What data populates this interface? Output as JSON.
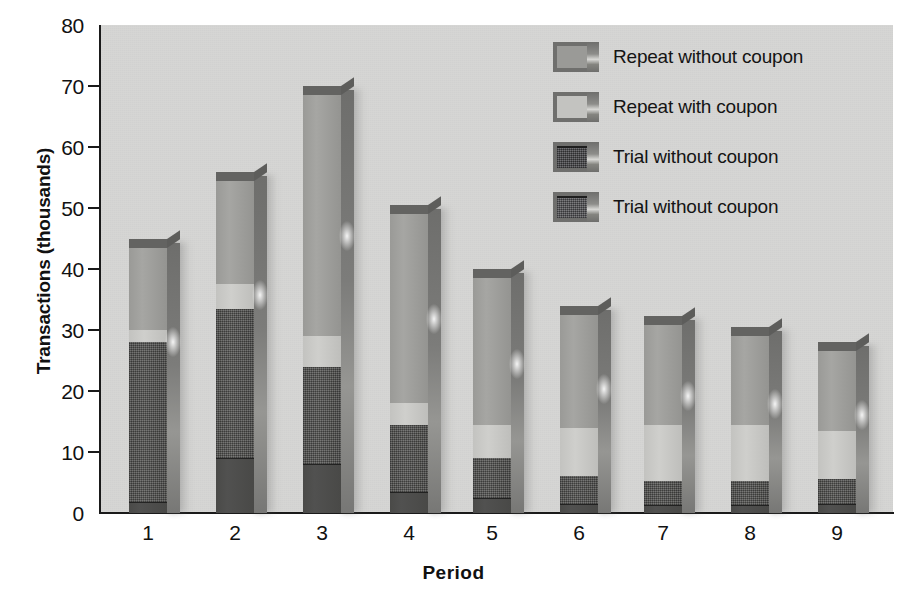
{
  "chart_data": {
    "type": "bar",
    "title": "",
    "subtitle": "",
    "xlabel": "Period",
    "ylabel": "Transactions (thousands)",
    "categories": [
      "1",
      "2",
      "3",
      "4",
      "5",
      "6",
      "7",
      "8",
      "9"
    ],
    "ylim": [
      0,
      80
    ],
    "yticks": [
      0,
      10,
      20,
      30,
      40,
      50,
      60,
      70,
      80
    ],
    "ytick_labels": [
      "0",
      "10",
      "20",
      "30",
      "40",
      "50",
      "60",
      "70",
      "80"
    ],
    "grid": false,
    "stacked": true,
    "legend_position": "top-right",
    "series": [
      {
        "name": "Trial with coupon",
        "legend_label": "Trial without coupon",
        "color": "#4a4a48",
        "values": [
          1.8,
          9.0,
          8.0,
          3.5,
          2.5,
          1.5,
          1.3,
          1.3,
          1.4
        ]
      },
      {
        "name": "Trial without coupon",
        "legend_label": "Trial without coupon",
        "color": "#4f4f4d",
        "values": [
          26.2,
          24.5,
          16.0,
          11.0,
          6.5,
          4.5,
          4.0,
          4.0,
          4.1
        ]
      },
      {
        "name": "Repeat with coupon",
        "legend_label": "Repeat with coupon",
        "color": "#c3c3c0",
        "values": [
          2.0,
          4.0,
          5.0,
          3.5,
          5.5,
          8.0,
          9.2,
          9.2,
          8.0
        ]
      },
      {
        "name": "Repeat without coupon",
        "legend_label": "Repeat without coupon",
        "color": "#9a9a97",
        "values": [
          13.5,
          17.0,
          39.5,
          31.0,
          24.0,
          18.5,
          16.3,
          14.5,
          13.0
        ]
      }
    ],
    "totals": [
      43.5,
      54.5,
      68.5,
      49.0,
      38.5,
      32.5,
      30.8,
      29.0,
      26.5
    ]
  },
  "legend": {
    "items": [
      {
        "label": "Repeat without coupon",
        "swatch": "#9a9a97"
      },
      {
        "label": "Repeat with coupon",
        "swatch": "#c3c3c0"
      },
      {
        "label": "Trial without coupon",
        "swatch": "#47474a"
      },
      {
        "label": "Trial without coupon",
        "swatch": "#56565a"
      }
    ]
  },
  "colors": {
    "plot_background": "#d6d6d4",
    "page_background": "#ffffff",
    "axis": "#1a1a1a",
    "text": "#111111"
  }
}
